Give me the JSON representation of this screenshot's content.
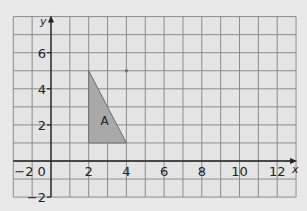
{
  "diagram": {
    "type": "coordinate-grid",
    "axes": {
      "x_label": "x",
      "y_label": "y",
      "x_range": [
        -2,
        13
      ],
      "y_range": [
        -2,
        8
      ],
      "x_ticks": [
        {
          "value": -2,
          "label": "−2"
        },
        {
          "value": 0,
          "label": "0"
        },
        {
          "value": 2,
          "label": "2"
        },
        {
          "value": 4,
          "label": "4"
        },
        {
          "value": 6,
          "label": "6"
        },
        {
          "value": 8,
          "label": "8"
        },
        {
          "value": 10,
          "label": "10"
        },
        {
          "value": 12,
          "label": "12"
        }
      ],
      "y_ticks": [
        {
          "value": 6,
          "label": "6"
        },
        {
          "value": 4,
          "label": "4"
        },
        {
          "value": 2,
          "label": "2"
        },
        {
          "value": -2,
          "label": "−2"
        }
      ]
    },
    "shapes": [
      {
        "name": "A",
        "label": "A",
        "vertices": [
          [
            2,
            5
          ],
          [
            2,
            1
          ],
          [
            4,
            1
          ]
        ],
        "fill": "#a9a9a9",
        "stroke": "#6e6e6e"
      }
    ],
    "points": [
      {
        "x": 4,
        "y": 5,
        "color": "#7a7a7a"
      }
    ],
    "colors": {
      "background": "#e9e9e9",
      "grid_bg": "#e4e4e4",
      "grid_line": "#8c8c8c",
      "axis": "#222222",
      "text": "#222222"
    }
  }
}
